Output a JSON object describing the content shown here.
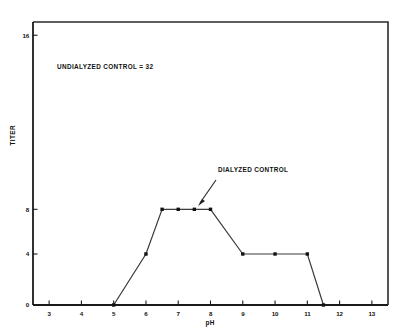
{
  "figure": {
    "background_color": "#ffffff",
    "line_color": "#3a3a3a",
    "marker_color": "#111111",
    "frame_color": "#2b2b2b"
  },
  "annotations": {
    "undialyzed": "UNDIALYZED CONTROL = 32",
    "dialyzed": "DIALYZED CONTROL"
  },
  "chart_data": {
    "type": "line",
    "title": "",
    "subtitle": "",
    "xlabel": "pH",
    "ylabel": "TITER",
    "xlim": [
      2.5,
      13.5
    ],
    "ylim": [
      0,
      16
    ],
    "grid": false,
    "legend": null,
    "x_ticks": [
      3,
      4,
      5,
      6,
      7,
      8,
      9,
      10,
      11,
      12,
      13
    ],
    "x_tick_labels": [
      "3",
      "4",
      "5",
      "6",
      "7",
      "8",
      "9",
      "10",
      "11",
      "12",
      "13"
    ],
    "y_ticks": [
      0,
      4,
      8,
      16
    ],
    "y_tick_labels": [
      "0",
      "4",
      "8",
      "16"
    ],
    "y_tick_pixel_fractions": [
      1.0,
      0.8198,
      0.6619,
      0.0468
    ],
    "series": [
      {
        "name": "Dialyzed control titer vs pH",
        "x": [
          5.0,
          6.0,
          6.5,
          7.0,
          7.5,
          8.0,
          9.0,
          10.0,
          11.0,
          11.5
        ],
        "values": [
          0,
          4,
          8,
          8,
          8,
          8,
          4,
          4,
          4,
          0
        ],
        "marker": "square",
        "line_style": "solid"
      }
    ],
    "annotations": [
      {
        "text": "UNDIALYZED CONTROL = 32",
        "x": 5.6,
        "y_label": "above plot interior",
        "arrow": false
      },
      {
        "text": "DIALYZED CONTROL",
        "x": 9.2,
        "y_label": "upper right of plateau",
        "arrow": true,
        "arrow_target_x": 7.5,
        "arrow_target_y": 8
      }
    ]
  }
}
